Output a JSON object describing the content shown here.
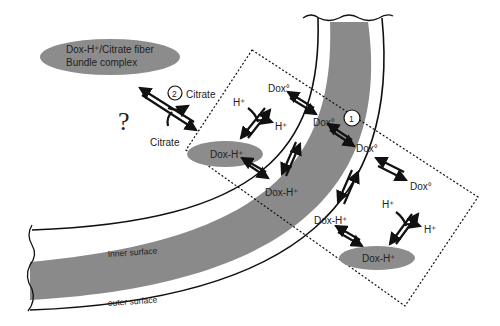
{
  "diagram": {
    "complex_label_line1": "Dox-H⁺/Citrate fiber",
    "complex_label_line2": "Bundle complex",
    "question_mark": "?",
    "step1": "1",
    "step2": "2",
    "citrate_top": "Citrate",
    "citrate_bottom": "Citrate",
    "dox0_a": "Dox°",
    "dox0_b": "Dox°",
    "dox0_c": "Dox°",
    "dox0_d": "Dox°",
    "h_plus_1": "H⁺",
    "h_plus_2": "H⁺",
    "h_plus_3": "H⁺",
    "h_plus_4": "H⁺",
    "doxh_ellipse_inner": "Dox-H⁺",
    "doxh_ellipse_outer": "Dox-H⁺",
    "doxh_inner_bilayer": "Dox-H⁺",
    "doxh_outer_bilayer": "Dox-H⁺",
    "inner_surface": "Inner surface",
    "outer_surface": "outer surface",
    "colors": {
      "membrane_core": "#8a8a8a",
      "ellipse_fill": "#8c8c8c",
      "ink": "#111111"
    }
  }
}
